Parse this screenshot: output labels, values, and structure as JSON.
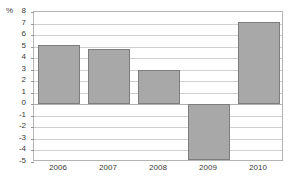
{
  "chart_data": {
    "type": "bar",
    "title": "",
    "subtitle": "",
    "xlabel": "",
    "ylabel": "%",
    "unit_label": "%",
    "categories": [
      "2006",
      "2007",
      "2008",
      "2009",
      "2010"
    ],
    "values": [
      5.1,
      4.8,
      2.95,
      -4.8,
      7.15
    ],
    "series": [
      {
        "name": "",
        "values": [
          5.1,
          4.8,
          2.95,
          -4.8,
          7.15
        ]
      }
    ],
    "ylim": [
      -5,
      8
    ],
    "yticks": [
      8,
      7,
      6,
      5,
      4,
      3,
      2,
      1,
      0,
      -1,
      -2,
      -3,
      -4,
      -5
    ],
    "ytick_labels": [
      "8",
      "7",
      "6",
      "5",
      "4",
      "3",
      "2",
      "1",
      "0",
      "-1",
      "-2",
      "-3",
      "-4",
      "-5"
    ],
    "grid": true,
    "grid_axis": "y",
    "legend": false,
    "legend_position": "none",
    "zero_line": 0,
    "colors": {
      "bar_fill": "#a8a8a8",
      "bar_border": "#7d7d7d",
      "gridline": "#cfcfcf",
      "zero_line": "#b0b0b0",
      "frame": "#b4b4b4",
      "text": "#3a3a3a",
      "background": "#ffffff"
    }
  }
}
